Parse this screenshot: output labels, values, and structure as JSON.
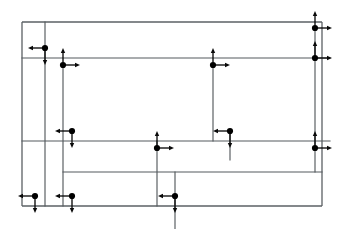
{
  "figure": {
    "width": 348,
    "height": 229,
    "background_color": "#ffffff",
    "line_color": "#555a5e",
    "node_color": "#000000",
    "arrow_color": "#0a0a0a",
    "node_radius": 3.1,
    "arrow_length": 17,
    "arrow_head_length": 5,
    "arrow_head_width": 4.4
  },
  "chart_data": {
    "type": "diagram",
    "xlim": [
      0,
      348
    ],
    "ylim": [
      0,
      229
    ],
    "grid": false,
    "legend": "none",
    "rails": [
      {
        "name": "outer-top-rail",
        "x1": 22,
        "y1": 22,
        "x2": 322,
        "y2": 22
      },
      {
        "name": "outer-left-rail",
        "x1": 22,
        "y1": 22,
        "x2": 22,
        "y2": 206
      },
      {
        "name": "outer-bottom-rail",
        "x1": 22,
        "y1": 206,
        "x2": 322,
        "y2": 206
      },
      {
        "name": "outer-right-rail",
        "x1": 322,
        "y1": 22,
        "x2": 322,
        "y2": 206
      },
      {
        "name": "upper-horizontal-rail",
        "x1": 22,
        "y1": 58,
        "x2": 330,
        "y2": 58
      },
      {
        "name": "middle-horizontal-rail",
        "x1": 22,
        "y1": 141,
        "x2": 330,
        "y2": 141
      },
      {
        "name": "lower-inner-rail",
        "x1": 63,
        "y1": 172,
        "x2": 322,
        "y2": 172
      },
      {
        "name": "left-vertical-rail",
        "x1": 45,
        "y1": 22,
        "x2": 45,
        "y2": 206
      },
      {
        "name": "second-vertical-rail",
        "x1": 63,
        "y1": 65,
        "x2": 63,
        "y2": 206
      },
      {
        "name": "center-vertical-rail",
        "x1": 157,
        "y1": 141,
        "x2": 157,
        "y2": 206
      },
      {
        "name": "mid-right-vertical-rail",
        "x1": 175,
        "y1": 172,
        "x2": 175,
        "y2": 229
      },
      {
        "name": "right-inner-vertical-rail",
        "x1": 213,
        "y1": 65,
        "x2": 213,
        "y2": 141
      },
      {
        "name": "right-node-vertical-rail",
        "x1": 230,
        "y1": 131,
        "x2": 230,
        "y2": 160
      },
      {
        "name": "far-right-vertical-rail",
        "x1": 315,
        "y1": 28,
        "x2": 315,
        "y2": 172
      }
    ],
    "nodes": [
      {
        "id": "n1",
        "name": "node-top-right-outer",
        "x": 315,
        "y": 28,
        "arrows": [
          "up",
          "right"
        ]
      },
      {
        "id": "n2",
        "name": "node-upper-left",
        "x": 45,
        "y": 48,
        "arrows": [
          "left",
          "down"
        ]
      },
      {
        "id": "n3",
        "name": "node-upper-left-lower",
        "x": 63,
        "y": 65,
        "arrows": [
          "up",
          "right"
        ]
      },
      {
        "id": "n4",
        "name": "node-upper-mid",
        "x": 213,
        "y": 65,
        "arrows": [
          "up",
          "right"
        ]
      },
      {
        "id": "n5",
        "name": "node-upper-right",
        "x": 315,
        "y": 58,
        "arrows": [
          "up",
          "right"
        ]
      },
      {
        "id": "n6",
        "name": "node-middle-left",
        "x": 72,
        "y": 131,
        "arrows": [
          "left",
          "down"
        ]
      },
      {
        "id": "n7",
        "name": "node-middle-center",
        "x": 157,
        "y": 148,
        "arrows": [
          "up",
          "right"
        ]
      },
      {
        "id": "n8",
        "name": "node-middle-right",
        "x": 230,
        "y": 131,
        "arrows": [
          "left",
          "down"
        ]
      },
      {
        "id": "n9",
        "name": "node-middle-far-right",
        "x": 315,
        "y": 148,
        "arrows": [
          "up",
          "right"
        ]
      },
      {
        "id": "n10",
        "name": "node-bottom-left",
        "x": 35,
        "y": 196,
        "arrows": [
          "left",
          "down"
        ]
      },
      {
        "id": "n11",
        "name": "node-bottom-left-inner",
        "x": 72,
        "y": 196,
        "arrows": [
          "left",
          "down"
        ]
      },
      {
        "id": "n12",
        "name": "node-bottom-center",
        "x": 175,
        "y": 196,
        "arrows": [
          "left",
          "down"
        ]
      }
    ],
    "node_count": 12,
    "rail_count": 14,
    "arrow_directions_legend": {
      "up": "arrow pointing toward top of figure",
      "down": "arrow pointing toward bottom of figure",
      "left": "arrow pointing toward left of figure",
      "right": "arrow pointing toward right of figure"
    }
  }
}
